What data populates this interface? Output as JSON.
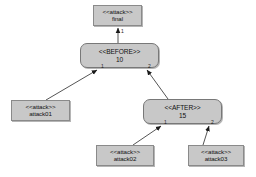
{
  "diagram": {
    "type": "attack-tree",
    "background": "#ffffff",
    "node_fill": "#c8c8c8",
    "node_stroke": "#8a8a8a",
    "edge_color": "#555555",
    "nodes": [
      {
        "id": "final",
        "shape": "rectangle",
        "stereotype": "<<attack>>",
        "name": "final",
        "x": 93,
        "y": 5,
        "w": 49,
        "h": 21
      },
      {
        "id": "before",
        "shape": "rounded-rectangle",
        "stereotype": "<<BEFORE>>",
        "name": "10",
        "x": 80,
        "y": 43,
        "w": 79,
        "h": 25
      },
      {
        "id": "after",
        "shape": "rounded-rectangle",
        "stereotype": "<<AFTER>>",
        "name": "15",
        "x": 143,
        "y": 99,
        "w": 79,
        "h": 25
      },
      {
        "id": "attack01",
        "shape": "rectangle",
        "stereotype": "<<attack>>",
        "name": "attack01",
        "x": 11,
        "y": 100,
        "w": 59,
        "h": 21
      },
      {
        "id": "attack02",
        "shape": "rectangle",
        "stereotype": "<<attack>>",
        "name": "attack02",
        "x": 96,
        "y": 145,
        "w": 58,
        "h": 21
      },
      {
        "id": "attack03",
        "shape": "rectangle",
        "stereotype": "<<attack>>",
        "name": "attack03",
        "x": 188,
        "y": 145,
        "w": 56,
        "h": 21
      }
    ],
    "edges": [
      {
        "id": "e-before-final",
        "from": "before",
        "to": "final",
        "port": "1",
        "port_x": 121,
        "port_y": 29
      },
      {
        "id": "e-attack01-before",
        "from": "attack01",
        "to": "before",
        "port": "1",
        "port_x": 101,
        "port_y": 64
      },
      {
        "id": "e-after-before",
        "from": "after",
        "to": "before",
        "port": "2",
        "port_x": 148,
        "port_y": 64
      },
      {
        "id": "e-attack02-after",
        "from": "attack02",
        "to": "after",
        "port": "1",
        "port_x": 164,
        "port_y": 120
      },
      {
        "id": "e-attack03-after",
        "from": "attack03",
        "to": "after",
        "port": "2",
        "port_x": 211,
        "port_y": 120
      }
    ]
  }
}
